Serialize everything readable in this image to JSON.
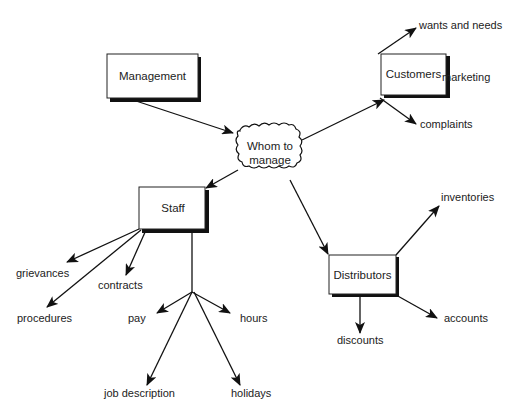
{
  "diagram": {
    "center": {
      "label_line1": "Whom to",
      "label_line2": "manage"
    },
    "nodes": {
      "management": "Management",
      "customers": "Customers",
      "staff": "Staff",
      "distributors": "Distributors"
    },
    "customers_branches": [
      "wants and needs",
      "marketing",
      "complaints"
    ],
    "staff_branches": [
      "grievances",
      "contracts",
      "procedures"
    ],
    "staff_sub_branches": [
      "pay",
      "hours",
      "job description",
      "holidays"
    ],
    "distributors_branches": [
      "inventories",
      "accounts",
      "discounts"
    ]
  }
}
